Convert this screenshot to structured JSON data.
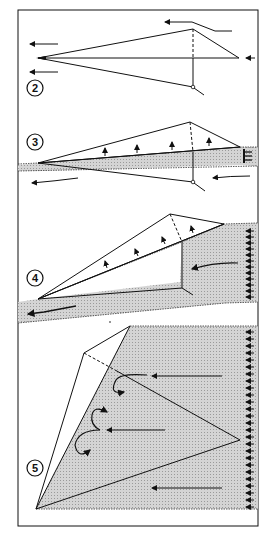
{
  "figure": {
    "type": "flow-separation-stages-diagram",
    "colors": {
      "line": "#111111",
      "shade": "#c8c8c8",
      "background": "#ffffff"
    },
    "panels": [
      {
        "label": "2",
        "description": "Wing planform with attached flow; freestream arrows point left; tip flow curving over trailing edge"
      },
      {
        "label": "3",
        "description": "Thin shaded separated band along root line; spanwise upward arrows on wing; left arrows beneath"
      },
      {
        "label": "4",
        "description": "Shaded separated region grows from trailing edge; upward spanwise arrows; multiple left arrows at right edge"
      },
      {
        "label": "5",
        "description": "Large shaded separated region with vortex curls; long leftward arrows; row of small arrows at right edge"
      }
    ]
  }
}
